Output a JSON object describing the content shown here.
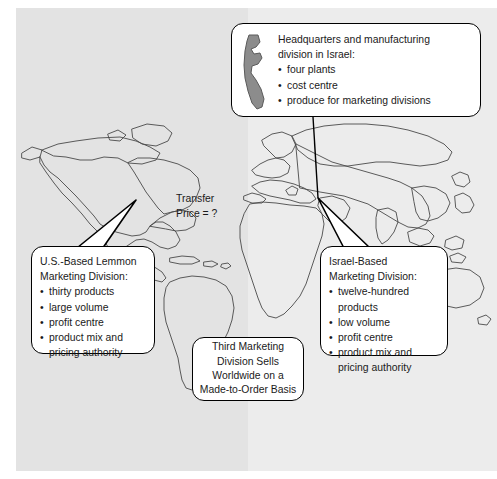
{
  "diagram": {
    "background": {
      "left_panel_color": "#e3e3e3",
      "right_panel_color": "#ececec",
      "map_outline_color": "#3a3a3a",
      "israel_shape_color": "#8c8c8c"
    },
    "callouts": {
      "headquarters": {
        "name": "headquarters-callout",
        "heading_line1": "Headquarters and manufacturing",
        "heading_line2": "division in Israel:",
        "bullets": [
          "four plants",
          "cost centre",
          "produce for marketing divisions"
        ],
        "icon": "israel-map-shape"
      },
      "us_marketing": {
        "name": "us-marketing-callout",
        "heading_line1": "U.S.-Based Lemmon",
        "heading_line2": "Marketing Division:",
        "bullets": [
          "thirty products",
          "large volume",
          "profit centre",
          "product mix and"
        ],
        "bullet_continuation": "pricing authority"
      },
      "israel_marketing": {
        "name": "israel-marketing-callout",
        "heading_line1": "Israel-Based",
        "heading_line2": "Marketing Division:",
        "bullets": [
          "twelve-hundred",
          "low volume",
          "profit centre",
          "product mix and"
        ],
        "bullet_continuation_1": "products",
        "bullet_continuation_2": "pricing authority"
      },
      "third_division": {
        "name": "third-division-callout",
        "line1": "Third Marketing",
        "line2": "Division Sells",
        "line3": "Worldwide on a",
        "line4": "Made-to-Order Basis"
      }
    },
    "labels": {
      "transfer_price_line1": "Transfer",
      "transfer_price_line2": "Price = ?"
    }
  }
}
